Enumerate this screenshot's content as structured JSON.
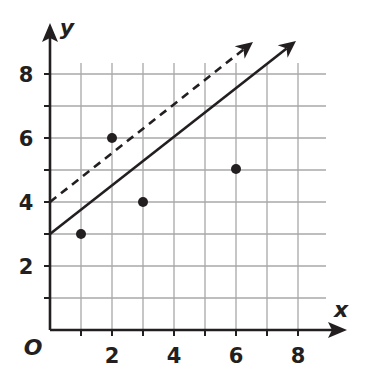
{
  "chart_data": {
    "type": "scatter",
    "title": "",
    "xlabel": "x",
    "ylabel": "y",
    "origin_label": "O",
    "xlim": [
      0,
      9
    ],
    "ylim": [
      0,
      9
    ],
    "grid": true,
    "x_ticks": [
      "2",
      "4",
      "6",
      "8"
    ],
    "y_ticks": [
      "2",
      "4",
      "6",
      "8"
    ],
    "points": [
      {
        "x": 1,
        "y": 3
      },
      {
        "x": 2,
        "y": 6
      },
      {
        "x": 3,
        "y": 4
      },
      {
        "x": 6,
        "y": 5
      }
    ],
    "lines": [
      {
        "name": "solid-trend-line",
        "style": "solid",
        "slope": 0.75,
        "intercept": 3,
        "x_start": 0,
        "x_end": 8
      },
      {
        "name": "dashed-line",
        "style": "dashed",
        "slope": 0.75,
        "intercept": 4,
        "x_start": 0,
        "x_end": 6.5
      }
    ]
  },
  "colors": {
    "ink": "#231f20",
    "grid": "#a6a6a6"
  }
}
